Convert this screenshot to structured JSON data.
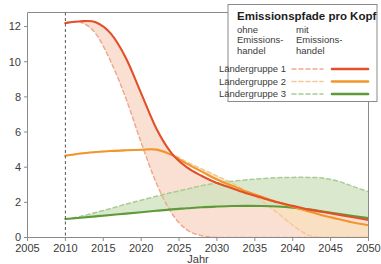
{
  "legend": {
    "title": "Emissionspfade pro Kopf",
    "column_headers": [
      {
        "id": "ohne",
        "lines": [
          "ohne",
          "Emissions-",
          "handel"
        ]
      },
      {
        "id": "mit",
        "lines": [
          "mit",
          "Emissions-",
          "handel"
        ]
      }
    ],
    "rows": [
      {
        "label": "Ländergruppe 1",
        "color": "#E2502A",
        "dashed_color": "#EFA98F"
      },
      {
        "label": "Ländergruppe 2",
        "color": "#F2952B",
        "dashed_color": "#F6C893"
      },
      {
        "label": "Ländergruppe 3",
        "color": "#5C9A3A",
        "dashed_color": "#A9CB94"
      }
    ]
  },
  "chart_data": {
    "type": "line",
    "title": "Emissionspfade pro Kopf",
    "xlabel": "Jahr",
    "ylabel": "",
    "xlim": [
      2005,
      2050
    ],
    "ylim": [
      0,
      12.8
    ],
    "xticks": [
      2005,
      2010,
      2015,
      2020,
      2025,
      2030,
      2035,
      2040,
      2045,
      2050
    ],
    "yticks": [
      0,
      2,
      4,
      6,
      8,
      10,
      12
    ],
    "grid": false,
    "legend_position": "top-right",
    "annotations": [
      {
        "type": "vertical-dashed-line",
        "x": 2010,
        "label": ""
      }
    ],
    "x": [
      2010,
      2012,
      2014,
      2016,
      2018,
      2020,
      2022,
      2024,
      2026,
      2028,
      2030,
      2032,
      2034,
      2036,
      2038,
      2040,
      2042,
      2044,
      2046,
      2048,
      2050
    ],
    "series": [
      {
        "name": "Ländergruppe 1",
        "variant": "mit Emissionshandel",
        "style": "solid",
        "color": "#E2502A",
        "values": [
          12.2,
          12.3,
          12.25,
          11.6,
          10.2,
          8.2,
          6.2,
          4.8,
          4.0,
          3.5,
          3.1,
          2.8,
          2.5,
          2.25,
          2.0,
          1.8,
          1.6,
          1.45,
          1.3,
          1.15,
          1.0
        ]
      },
      {
        "name": "Ländergruppe 1",
        "variant": "ohne Emissionshandel",
        "style": "dashed",
        "color": "#EFA98F",
        "values": [
          12.2,
          12.25,
          11.6,
          10.0,
          7.9,
          5.4,
          3.1,
          1.4,
          0.45,
          0.1,
          0.0,
          0.0,
          0.0,
          0.0,
          0.0,
          0.0,
          0.0,
          0.0,
          0.0,
          0.0,
          0.0
        ]
      },
      {
        "name": "Ländergruppe 2",
        "variant": "mit Emissionshandel",
        "style": "solid",
        "color": "#F2952B",
        "values": [
          4.65,
          4.78,
          4.86,
          4.92,
          4.96,
          4.99,
          5.0,
          4.7,
          4.2,
          3.75,
          3.3,
          2.95,
          2.6,
          2.3,
          2.0,
          1.75,
          1.5,
          1.25,
          1.05,
          0.85,
          0.7
        ]
      },
      {
        "name": "Ländergruppe 2",
        "variant": "ohne Emissionshandel",
        "style": "dashed",
        "color": "#F6C893",
        "values": [
          4.65,
          4.78,
          4.86,
          4.92,
          4.96,
          4.99,
          5.0,
          4.75,
          4.3,
          3.9,
          3.5,
          3.1,
          2.6,
          2.05,
          1.4,
          0.7,
          0.15,
          0.0,
          0.0,
          0.0,
          0.0
        ]
      },
      {
        "name": "Ländergruppe 3",
        "variant": "mit Emissionshandel",
        "style": "solid",
        "color": "#5C9A3A",
        "values": [
          1.05,
          1.12,
          1.2,
          1.28,
          1.36,
          1.44,
          1.52,
          1.6,
          1.66,
          1.72,
          1.76,
          1.79,
          1.8,
          1.79,
          1.76,
          1.7,
          1.6,
          1.48,
          1.35,
          1.22,
          1.1
        ]
      },
      {
        "name": "Ländergruppe 3",
        "variant": "ohne Emissionshandel",
        "style": "dashed",
        "color": "#A9CB94",
        "values": [
          1.05,
          1.2,
          1.42,
          1.65,
          1.9,
          2.12,
          2.35,
          2.55,
          2.75,
          2.95,
          3.1,
          3.2,
          3.28,
          3.35,
          3.4,
          3.42,
          3.42,
          3.38,
          3.2,
          2.9,
          2.6
        ]
      }
    ]
  },
  "colors": {
    "group1": "#E2502A",
    "group1_band": "#F7D7C6",
    "group2": "#F2952B",
    "group2_band": "#FAE0BE",
    "group3": "#5C9A3A",
    "group3_band": "#CFE3BF",
    "axis": "#8a8a8a",
    "text": "#3b3b3b"
  }
}
